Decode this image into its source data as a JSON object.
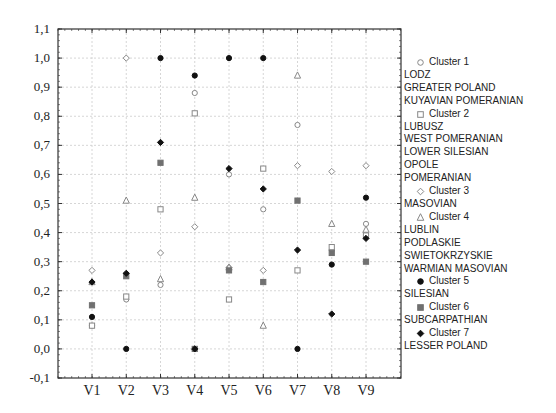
{
  "chart_data": {
    "type": "scatter",
    "title": "",
    "xlabel": "",
    "ylabel": "",
    "categories": [
      "V1",
      "V2",
      "V3",
      "V4",
      "V5",
      "V6",
      "V7",
      "V8",
      "V9"
    ],
    "ylim": [
      -0.1,
      1.1
    ],
    "yticks": [
      "1,1",
      "1,0",
      "0,9",
      "0,8",
      "0,7",
      "0,6",
      "0,5",
      "0,4",
      "0,3",
      "0,2",
      "0,1",
      "0,0",
      "-0,1"
    ],
    "grid": true,
    "legend_position": "right",
    "series": [
      {
        "name": "Cluster 1",
        "marker": "circle-open",
        "members": [
          "LODZ",
          "GREATER POLAND",
          "KUYAVIAN POMERANIAN"
        ],
        "values": [
          0.08,
          0.17,
          0.22,
          0.88,
          0.6,
          0.48,
          0.77,
          0.34,
          0.43
        ]
      },
      {
        "name": "Cluster 2",
        "marker": "square-open",
        "members": [
          "LUBUSZ",
          "WEST POMERANIAN",
          "LOWER SILESIAN",
          "OPOLE",
          "POMERANIAN"
        ],
        "values": [
          0.08,
          0.18,
          0.48,
          0.81,
          0.17,
          0.62,
          0.27,
          0.35,
          0.39
        ]
      },
      {
        "name": "Cluster 3",
        "marker": "diamond-open",
        "members": [
          "MASOVIAN"
        ],
        "values": [
          0.27,
          1.0,
          0.33,
          0.42,
          0.28,
          0.27,
          0.63,
          0.61,
          0.63
        ]
      },
      {
        "name": "Cluster 4",
        "marker": "triangle-open",
        "members": [
          "LUBLIN",
          "PODLASKIE",
          "SWIETOKRZYSKIE",
          "WARMIAN MASOVIAN"
        ],
        "values": [
          0.23,
          0.51,
          0.24,
          0.52,
          0.28,
          0.08,
          0.94,
          0.43,
          0.41
        ]
      },
      {
        "name": "Cluster 5",
        "marker": "circle-filled",
        "members": [
          "SILESIAN"
        ],
        "values": [
          0.11,
          0.0,
          1.0,
          0.94,
          1.0,
          1.0,
          0.0,
          0.29,
          0.52
        ]
      },
      {
        "name": "Cluster 6",
        "marker": "square-filled",
        "members": [
          "SUBCARPATHIAN"
        ],
        "values": [
          0.15,
          0.25,
          0.64,
          0.0,
          0.27,
          0.23,
          0.51,
          0.33,
          0.3
        ]
      },
      {
        "name": "Cluster 7",
        "marker": "diamond-filled",
        "members": [
          "LESSER POLAND"
        ],
        "values": [
          0.23,
          0.26,
          0.71,
          0.0,
          0.62,
          0.55,
          0.34,
          0.12,
          0.38
        ]
      }
    ]
  },
  "legend": {
    "groups": [
      {
        "label": "Cluster 1",
        "members": [
          "LODZ",
          "GREATER POLAND",
          "KUYAVIAN POMERANIAN"
        ]
      },
      {
        "label": "Cluster 2",
        "members": [
          "LUBUSZ",
          "WEST POMERANIAN",
          "LOWER SILESIAN",
          "OPOLE",
          "POMERANIAN"
        ]
      },
      {
        "label": "Cluster 3",
        "members": [
          "MASOVIAN"
        ]
      },
      {
        "label": "Cluster 4",
        "members": [
          "LUBLIN",
          "PODLASKIE",
          "SWIETOKRZYSKIE",
          "WARMIAN MASOVIAN"
        ]
      },
      {
        "label": "Cluster 5",
        "members": [
          "SILESIAN"
        ]
      },
      {
        "label": "Cluster 6",
        "members": [
          "SUBCARPATHIAN"
        ]
      },
      {
        "label": "Cluster 7",
        "members": [
          "LESSER POLAND"
        ]
      }
    ]
  },
  "colors": {
    "open_marker": "#888888",
    "filled_black": "#111111",
    "filled_gray": "#707070",
    "axis": "#333333",
    "grid": "#cccccc"
  }
}
